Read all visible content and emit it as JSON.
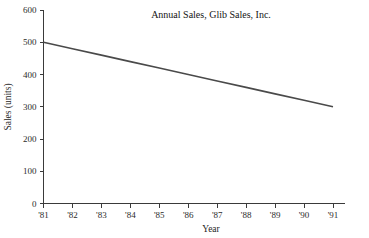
{
  "chart_data": {
    "type": "line",
    "title": "Annual Sales, Glib Sales, Inc.",
    "xlabel": "Year",
    "ylabel": "Sales (units)",
    "x": [
      "'81",
      "'82",
      "'83",
      "'84",
      "'85",
      "'86",
      "'87",
      "'88",
      "'89",
      "'90",
      "'91"
    ],
    "categories": [
      "'81",
      "'82",
      "'83",
      "'84",
      "'85",
      "'86",
      "'87",
      "'88",
      "'89",
      "'90",
      "'91"
    ],
    "values": [
      500,
      480,
      460,
      440,
      420,
      400,
      380,
      360,
      340,
      320,
      300
    ],
    "series": [
      {
        "name": "Annual Sales",
        "values": [
          500,
          480,
          460,
          440,
          420,
          400,
          380,
          360,
          340,
          320,
          300
        ]
      }
    ],
    "xlim": [
      "'81",
      "'91"
    ],
    "ylim": [
      0,
      600
    ],
    "ytick_labels": [
      "0",
      "100",
      "200",
      "300",
      "400",
      "500",
      "600"
    ],
    "ytick_values": [
      0,
      100,
      200,
      300,
      400,
      500,
      600
    ],
    "xtick_labels": [
      "'81",
      "'82",
      "'83",
      "'84",
      "'85",
      "'86",
      "'87",
      "'88",
      "'89",
      "'90",
      "'91"
    ],
    "grid": false,
    "legend": false,
    "legend_position": "none",
    "line_color": "#4a4a4a",
    "axis_color": "#3a3a3a",
    "background_color": "#ffffff",
    "annotations": []
  }
}
